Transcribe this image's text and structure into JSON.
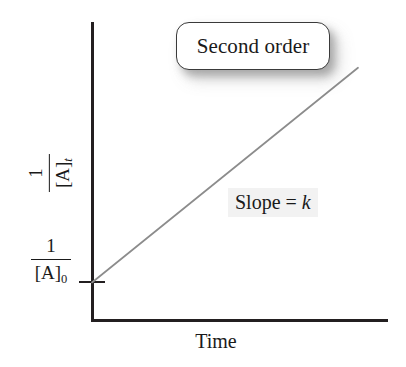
{
  "figure": {
    "background_color": "#ffffff",
    "width": 406,
    "height": 367
  },
  "chart_data": {
    "type": "line",
    "title": "",
    "subtitle": "",
    "xlabel": "Time",
    "ylabel": "1/[A]t",
    "ylabel_numerator": "1",
    "ylabel_denominator": "[A]",
    "ylabel_denominator_subscript": "t",
    "xlim": [
      0,
      1
    ],
    "ylim": [
      0,
      1
    ],
    "grid": false,
    "legend": "none",
    "series": [
      {
        "name": "Second order",
        "color": "#8c8c8c",
        "x": [
          0.0,
          1.0
        ],
        "y": [
          0.123,
          0.846
        ],
        "description": "Straight line of constant positive slope rising from the y-intercept 1/[A]0"
      }
    ],
    "tick_labels": {
      "y": [
        {
          "value": 0.123,
          "label": "1/[A]0",
          "numerator": "1",
          "denominator": "[A]",
          "denominator_subscript": "0"
        }
      ],
      "x": []
    },
    "annotations": [
      {
        "name": "order-callout",
        "text": "Second order",
        "style": "rounded-box-with-shadow",
        "box_fill": "#ffffff",
        "box_border": "#3a3a3a"
      },
      {
        "name": "slope-annotation",
        "text_plain": "Slope = k",
        "text_prefix": "Slope = ",
        "text_italic": "k",
        "style": "light-gray-highlight",
        "highlight_color": "#e8e8e8"
      }
    ]
  },
  "axes": {
    "color": "#231f20",
    "y_axis_name": "y-axis-line",
    "x_axis_name": "x-axis-line",
    "tick_name": "y-axis-intercept-tick"
  },
  "labels": {
    "x_axis_title": "Time",
    "callout": "Second order",
    "slope_prefix": "Slope = ",
    "slope_symbol": "k",
    "fraction_numerator": "1",
    "fraction_denominator_base": "[A]",
    "y_title_subscript": "t",
    "y_intercept_subscript": "0"
  }
}
